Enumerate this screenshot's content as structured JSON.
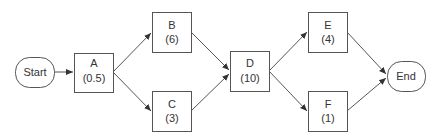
{
  "diagram": {
    "type": "activity-on-node network",
    "colors": {
      "stroke": "#555555",
      "text": "#333333",
      "fill": "#ffffff"
    },
    "nodes": [
      {
        "id": "start",
        "label": "Start",
        "duration": "",
        "shape": "terminal",
        "x": 15,
        "y": 57,
        "w": 39,
        "h": 30
      },
      {
        "id": "A",
        "label": "A",
        "duration": "(0.5)",
        "shape": "box",
        "x": 74,
        "y": 53,
        "w": 39,
        "h": 39
      },
      {
        "id": "B",
        "label": "B",
        "duration": "(6)",
        "shape": "box",
        "x": 152,
        "y": 12,
        "w": 39,
        "h": 40
      },
      {
        "id": "C",
        "label": "C",
        "duration": "(3)",
        "shape": "box",
        "x": 152,
        "y": 91,
        "w": 39,
        "h": 40
      },
      {
        "id": "D",
        "label": "D",
        "duration": "(10)",
        "shape": "box",
        "x": 230,
        "y": 51,
        "w": 39,
        "h": 40
      },
      {
        "id": "E",
        "label": "E",
        "duration": "(4)",
        "shape": "box",
        "x": 308,
        "y": 12,
        "w": 39,
        "h": 40
      },
      {
        "id": "F",
        "label": "F",
        "duration": "(1)",
        "shape": "box",
        "x": 308,
        "y": 91,
        "w": 39,
        "h": 40
      },
      {
        "id": "end",
        "label": "End",
        "duration": "",
        "shape": "terminal",
        "x": 387,
        "y": 61,
        "w": 38,
        "h": 30
      }
    ],
    "edges": [
      {
        "from": "start",
        "to": "A"
      },
      {
        "from": "A",
        "to": "B"
      },
      {
        "from": "A",
        "to": "C"
      },
      {
        "from": "B",
        "to": "D"
      },
      {
        "from": "C",
        "to": "D"
      },
      {
        "from": "D",
        "to": "E"
      },
      {
        "from": "D",
        "to": "F"
      },
      {
        "from": "E",
        "to": "end"
      },
      {
        "from": "F",
        "to": "end"
      }
    ]
  }
}
